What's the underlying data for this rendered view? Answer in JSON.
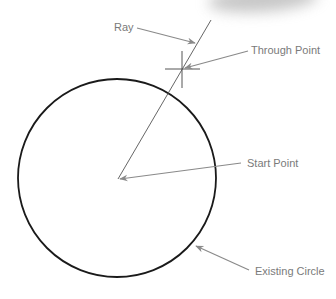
{
  "diagram": {
    "type": "geometry-construction",
    "colors": {
      "circle": "#1a1a1a",
      "ray": "#555555",
      "leader": "#8a8a8a",
      "label_text": "#7a7a7a",
      "background": "#ffffff"
    },
    "labels": {
      "ray": "Ray",
      "through_point": "Through Point",
      "start_point": "Start Point",
      "existing_circle": "Existing Circle"
    },
    "elements": {
      "circle": {
        "cx": 117,
        "cy": 178,
        "r": 99
      },
      "ray": {
        "x1": 118,
        "y1": 179,
        "x2": 211,
        "y2": 20
      },
      "through_point_marker": {
        "x": 182,
        "y": 69
      },
      "start_point": {
        "x": 118,
        "y": 179
      }
    }
  }
}
